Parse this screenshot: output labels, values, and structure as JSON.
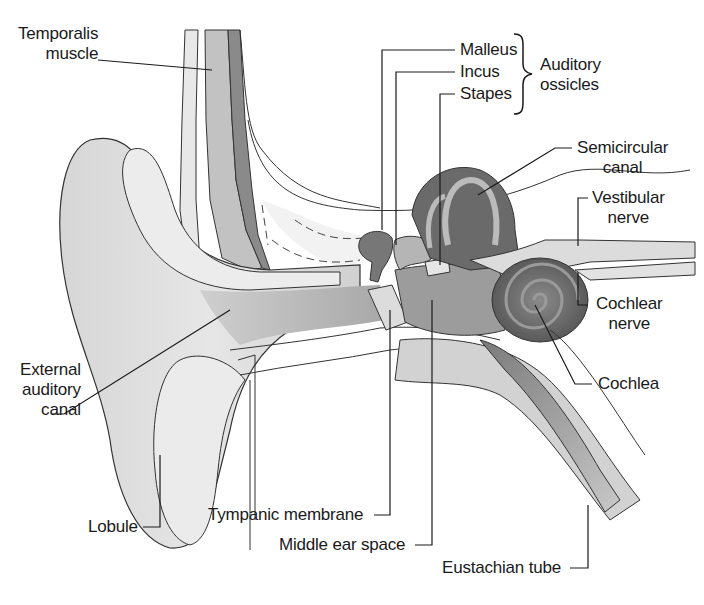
{
  "diagram": {
    "type": "anatomical-illustration",
    "subject": "ear",
    "labels": {
      "temporalis": [
        "Temporalis",
        "muscle"
      ],
      "malleus": "Malleus",
      "incus": "Incus",
      "stapes": "Stapes",
      "ossicles_group": [
        "Auditory",
        "ossicles"
      ],
      "semicircular": [
        "Semicircular",
        "canal"
      ],
      "vestibular": [
        "Vestibular",
        "nerve"
      ],
      "cochlear_nerve": [
        "Cochlear",
        "nerve"
      ],
      "cochlea": "Cochlea",
      "external_canal": [
        "External",
        "auditory",
        "canal"
      ],
      "lobule": "Lobule",
      "tympanic": "Tympanic membrane",
      "middle_ear": "Middle ear space",
      "eustachian": "Eustachian tube"
    },
    "colors": {
      "outline": "#333333",
      "skin_light": "#e4e4e4",
      "skin_mid": "#cfcfcf",
      "canal": "#bdbdbd",
      "dark_tissue": "#6e6e6e",
      "mid_tissue": "#9a9a9a",
      "leader": "#1a1a1a"
    }
  }
}
